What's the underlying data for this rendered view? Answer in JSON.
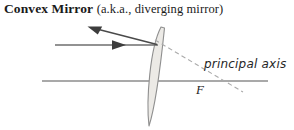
{
  "caption": {
    "term": "Convex Mirror",
    "alias": "(a.k.a., diverging mirror)"
  },
  "diagram": {
    "type": "optics-ray-diagram",
    "principal_axis_label": "principal axis",
    "focal_point_label": "F",
    "colors": {
      "ray": "#555555",
      "axis": "#8c8c8c",
      "mirror_stroke": "#8a8a8a",
      "mirror_fill": "#e8e6e2",
      "dashed": "#a8a8a8",
      "text": "#262626"
    },
    "geometry": {
      "principal_axis": {
        "x1": 42,
        "y1": 81,
        "x2": 268,
        "y2": 81
      },
      "incident_ray": {
        "x1": 55,
        "y1": 45,
        "x2": 158,
        "y2": 45
      },
      "incident_arrow": {
        "x": 120,
        "y": 45
      },
      "reflected_ray": {
        "x1": 158,
        "y1": 45,
        "x2": 88,
        "y2": 27
      },
      "reflected_arrow": {
        "x": 90,
        "y": 27.5
      },
      "virtual_ray_dashed": {
        "x1": 156,
        "y1": 41,
        "x2": 242,
        "y2": 91
      },
      "focal_point": {
        "x": 205,
        "y": 81
      },
      "mirror": {
        "top": {
          "x": 161,
          "y": 27
        },
        "vertex": {
          "x": 154,
          "y": 81
        },
        "bottom": {
          "x": 149,
          "y": 126
        },
        "bulge_direction": "left"
      }
    }
  }
}
